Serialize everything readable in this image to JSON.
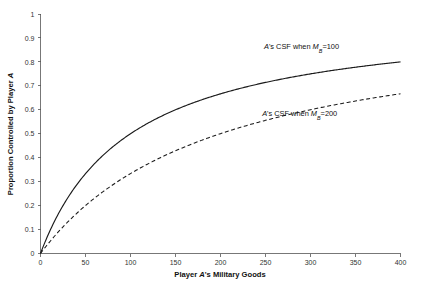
{
  "chart_data": {
    "type": "line",
    "title": "",
    "xlabel": "Player A's Military Goods",
    "ylabel": "Proportion Controlled by Player A",
    "xlim": [
      0,
      400
    ],
    "ylim": [
      0,
      1
    ],
    "grid": false,
    "legend_position": "inline-annotations",
    "xticks": [
      0,
      50,
      100,
      150,
      200,
      250,
      300,
      350,
      400
    ],
    "xtick_labels": [
      "0",
      "50",
      "100",
      "150",
      "200",
      "250",
      "300",
      "350",
      "400"
    ],
    "yticks": [
      0,
      0.1,
      0.2,
      0.3,
      0.4,
      0.5,
      0.6,
      0.7,
      0.8,
      0.9,
      1
    ],
    "ytick_labels": [
      "0",
      "0.1",
      "0.2",
      "0.3",
      "0.4",
      "0.5",
      "0.6",
      "0.7",
      "0.8",
      "0.9",
      "1"
    ],
    "x": [
      0,
      20,
      40,
      60,
      80,
      100,
      120,
      140,
      160,
      180,
      200,
      220,
      240,
      260,
      280,
      300,
      320,
      340,
      360,
      380,
      400
    ],
    "series": [
      {
        "name": "A's CSF when MB=100",
        "style": "solid",
        "color": "#1a1a1a",
        "values": [
          0,
          0.167,
          0.286,
          0.375,
          0.444,
          0.5,
          0.545,
          0.583,
          0.615,
          0.643,
          0.667,
          0.688,
          0.706,
          0.722,
          0.737,
          0.75,
          0.762,
          0.773,
          0.783,
          0.792,
          0.8
        ]
      },
      {
        "name": "A's CSF when MB=200",
        "style": "dashed",
        "color": "#1a1a1a",
        "values": [
          0,
          0.091,
          0.167,
          0.231,
          0.286,
          0.333,
          0.375,
          0.412,
          0.444,
          0.474,
          0.5,
          0.524,
          0.545,
          0.565,
          0.583,
          0.6,
          0.615,
          0.63,
          0.643,
          0.655,
          0.667
        ]
      }
    ],
    "annotations": [
      {
        "id": "annotation-csf-100",
        "prefix": "A",
        "middle": "'s CSF when ",
        "symbol": "M",
        "subscript": "B",
        "equals": "=",
        "value": "100",
        "x_data": 290,
        "y_data": 0.855
      },
      {
        "id": "annotation-csf-200",
        "prefix": "A",
        "middle": "'s CSF when ",
        "symbol": "M",
        "subscript": "B",
        "equals": "=",
        "value": "200",
        "x_data": 288,
        "y_data": 0.575
      }
    ]
  },
  "axis_titles": {
    "x_prefix": "Player ",
    "x_italic": "A",
    "x_suffix": "'s Military Goods",
    "y_prefix": "Proportion Controlled by Player ",
    "y_italic": "A"
  }
}
